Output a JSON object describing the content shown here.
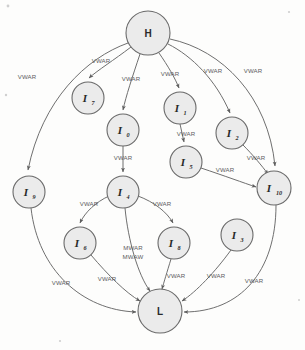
{
  "diagram": {
    "type": "directed-graph",
    "title": "",
    "background_color": "#fdfdfc",
    "node_fill": "#ebebeb",
    "node_stroke": "#6a6a6a",
    "edge_color": "#6f6f6f",
    "label_color": "#5c5c5c",
    "nodes": [
      {
        "id": "H",
        "label": "H",
        "sub": "",
        "cx": 148,
        "cy": 33,
        "r": 22,
        "style": "plain"
      },
      {
        "id": "I7",
        "label": "I",
        "sub": "7",
        "cx": 88,
        "cy": 98,
        "r": 16,
        "style": "italic"
      },
      {
        "id": "I0",
        "label": "I",
        "sub": "0",
        "cx": 123,
        "cy": 130,
        "r": 16,
        "style": "italic"
      },
      {
        "id": "I1",
        "label": "I",
        "sub": "1",
        "cx": 180,
        "cy": 108,
        "r": 16,
        "style": "italic"
      },
      {
        "id": "I2",
        "label": "I",
        "sub": "2",
        "cx": 232,
        "cy": 133,
        "r": 16,
        "style": "italic"
      },
      {
        "id": "I5",
        "label": "I",
        "sub": "5",
        "cx": 186,
        "cy": 162,
        "r": 16,
        "style": "italic"
      },
      {
        "id": "I10",
        "label": "I",
        "sub": "10",
        "cx": 274,
        "cy": 188,
        "r": 17,
        "style": "italic"
      },
      {
        "id": "I9",
        "label": "I",
        "sub": "9",
        "cx": 29,
        "cy": 192,
        "r": 16,
        "style": "italic"
      },
      {
        "id": "I4",
        "label": "I",
        "sub": "4",
        "cx": 123,
        "cy": 192,
        "r": 16,
        "style": "italic"
      },
      {
        "id": "I6",
        "label": "I",
        "sub": "6",
        "cx": 80,
        "cy": 243,
        "r": 16,
        "style": "italic"
      },
      {
        "id": "I8",
        "label": "I",
        "sub": "8",
        "cx": 174,
        "cy": 243,
        "r": 16,
        "style": "italic"
      },
      {
        "id": "I3",
        "label": "I",
        "sub": "3",
        "cx": 237,
        "cy": 235,
        "r": 16,
        "style": "italic"
      },
      {
        "id": "L",
        "label": "L",
        "sub": "",
        "cx": 160,
        "cy": 311,
        "r": 22,
        "style": "plain"
      }
    ],
    "edges": [
      {
        "from": "H",
        "to": "I9",
        "label": "VWAR"
      },
      {
        "from": "H",
        "to": "I7",
        "label": "VWAR"
      },
      {
        "from": "H",
        "to": "I0",
        "label": "VWAR"
      },
      {
        "from": "H",
        "to": "I1",
        "label": "VWAR"
      },
      {
        "from": "H",
        "to": "I2",
        "label": "VWAR"
      },
      {
        "from": "H",
        "to": "I10",
        "label": "VWAR"
      },
      {
        "from": "I0",
        "to": "I4",
        "label": "VWAR"
      },
      {
        "from": "I1",
        "to": "I5",
        "label": "VWAR"
      },
      {
        "from": "I2",
        "to": "I10",
        "label": "VWAR"
      },
      {
        "from": "I5",
        "to": "I10",
        "label": "VWAR"
      },
      {
        "from": "I4",
        "to": "I6",
        "label": "VWAR"
      },
      {
        "from": "I4",
        "to": "I8",
        "label": "VWAR"
      },
      {
        "from": "I4",
        "to": "L",
        "label": "MWAR MWAW"
      },
      {
        "from": "I9",
        "to": "L",
        "label": "VWAR"
      },
      {
        "from": "I6",
        "to": "L",
        "label": "VWAR"
      },
      {
        "from": "I8",
        "to": "L",
        "label": "VWAR"
      },
      {
        "from": "I3",
        "to": "L",
        "label": "VWAR"
      },
      {
        "from": "I10",
        "to": "L",
        "label": "VWAR"
      }
    ],
    "edge_labels": {
      "h_to_i9": "VWAR",
      "h_to_i7": "VWAR",
      "h_to_i0": "VWAR",
      "h_to_i1": "VWAR",
      "h_to_i2": "VWAR",
      "h_to_i10": "VWAR",
      "i0_to_i4": "VWAR",
      "i1_to_i5": "VWAR",
      "i2_to_i10": "VWAR",
      "i5_to_i10": "VWAR",
      "i4_to_i6": "VWAR",
      "i4_to_i8": "VWAR",
      "i4_to_l_line1": "MWAR",
      "i4_to_l_line2": "MWAW",
      "i9_to_l": "VWAR",
      "i6_to_l": "VWAR",
      "i8_to_l": "VWAR",
      "i3_to_l": "VWAR",
      "i10_to_l": "VWAR"
    }
  }
}
